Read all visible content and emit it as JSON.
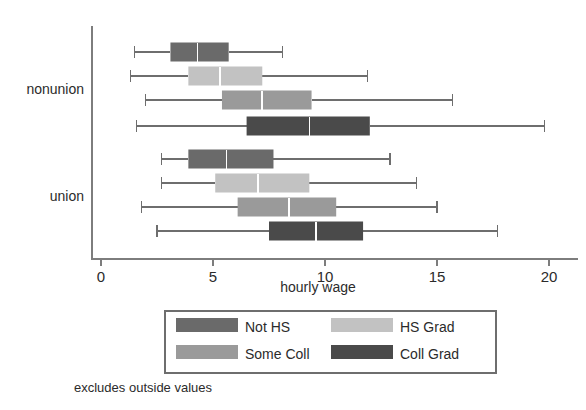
{
  "chart_data": {
    "type": "box",
    "title": "",
    "xlabel": "hourly wage",
    "ylabel": "",
    "xlim": [
      0,
      21.5
    ],
    "xticks": [
      0,
      5,
      10,
      15,
      20
    ],
    "xticklabels": [
      "0",
      "5",
      "10",
      "15",
      "20"
    ],
    "grid": false,
    "note": "excludes outside values",
    "groups": [
      "nonunion",
      "union"
    ],
    "legend": {
      "position": "below-axis",
      "entries": [
        {
          "label": "Not HS",
          "color": "#6a6a6a"
        },
        {
          "label": "HS Grad",
          "color": "#c2c2c2"
        },
        {
          "label": "Some Coll",
          "color": "#9a9a9a"
        },
        {
          "label": "Coll Grad",
          "color": "#4a4a4a"
        }
      ]
    },
    "boxes": [
      {
        "group": "nonunion",
        "series": "Not HS",
        "color": "#6a6a6a",
        "whisker_low": 1.5,
        "q1": 3.1,
        "median": 4.3,
        "q3": 5.7,
        "whisker_high": 8.1
      },
      {
        "group": "nonunion",
        "series": "HS Grad",
        "color": "#c2c2c2",
        "whisker_low": 1.3,
        "q1": 3.9,
        "median": 5.3,
        "q3": 7.2,
        "whisker_high": 11.9
      },
      {
        "group": "nonunion",
        "series": "Some Coll",
        "color": "#9a9a9a",
        "whisker_low": 2.0,
        "q1": 5.4,
        "median": 7.2,
        "q3": 9.4,
        "whisker_high": 15.7
      },
      {
        "group": "nonunion",
        "series": "Coll Grad",
        "color": "#4a4a4a",
        "whisker_low": 1.6,
        "q1": 6.5,
        "median": 9.3,
        "q3": 12.0,
        "whisker_high": 19.8
      },
      {
        "group": "union",
        "series": "Not HS",
        "color": "#6a6a6a",
        "whisker_low": 2.7,
        "q1": 3.9,
        "median": 5.6,
        "q3": 7.7,
        "whisker_high": 12.9
      },
      {
        "group": "union",
        "series": "HS Grad",
        "color": "#c2c2c2",
        "whisker_low": 2.7,
        "q1": 5.1,
        "median": 7.0,
        "q3": 9.3,
        "whisker_high": 14.1
      },
      {
        "group": "union",
        "series": "Some Coll",
        "color": "#9a9a9a",
        "whisker_low": 1.8,
        "q1": 6.1,
        "median": 8.4,
        "q3": 10.5,
        "whisker_high": 15.0
      },
      {
        "group": "union",
        "series": "Coll Grad",
        "color": "#4a4a4a",
        "whisker_low": 2.5,
        "q1": 7.5,
        "median": 9.6,
        "q3": 11.7,
        "whisker_high": 17.7
      }
    ]
  },
  "axis": {
    "x_title": "hourly wage",
    "category_labels": [
      "nonunion",
      "union"
    ],
    "tick_labels": [
      "0",
      "5",
      "10",
      "15",
      "20"
    ]
  },
  "legend": {
    "items": [
      "Not HS",
      "HS Grad",
      "Some Coll",
      "Coll Grad"
    ]
  },
  "footer": {
    "note": "excludes outside values"
  },
  "colors": {
    "not_hs": "#6a6a6a",
    "hs_grad": "#c2c2c2",
    "some_coll": "#9a9a9a",
    "coll_grad": "#4a4a4a",
    "axis": "#7d7d7d",
    "text": "#2b2b2b"
  }
}
